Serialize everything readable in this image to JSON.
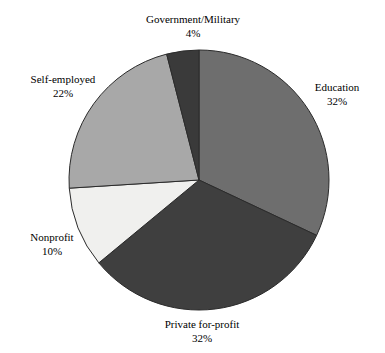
{
  "chart_data": {
    "type": "pie",
    "title": "",
    "subtitle": "",
    "xlabel": "",
    "ylabel": "",
    "legend_position": "none",
    "grid": false,
    "labels_inline": true,
    "start_angle_deg": 0,
    "direction": "clockwise",
    "categories": [
      "Education",
      "Private for-profit",
      "Nonprofit",
      "Self-employed",
      "Government/Military"
    ],
    "values": [
      32,
      32,
      10,
      22,
      4
    ],
    "value_suffix": "%",
    "slices": [
      {
        "name": "Education",
        "value": 32,
        "value_label": "32%",
        "color": "#6e6e6e",
        "start_deg": 0,
        "end_deg": 115.2
      },
      {
        "name": "Private for-profit",
        "value": 32,
        "value_label": "32%",
        "color": "#3f3f3f",
        "start_deg": 115.2,
        "end_deg": 230.4
      },
      {
        "name": "Nonprofit",
        "value": 10,
        "value_label": "10%",
        "color": "#f0f0ee",
        "start_deg": 230.4,
        "end_deg": 266.4
      },
      {
        "name": "Self-employed",
        "value": 22,
        "value_label": "22%",
        "color": "#a8a8a8",
        "start_deg": 266.4,
        "end_deg": 345.6
      },
      {
        "name": "Government/Military",
        "value": 4,
        "value_label": "4%",
        "color": "#3a3a3a",
        "start_deg": 345.6,
        "end_deg": 360
      }
    ],
    "outline_color": "#2b2b2b"
  },
  "labels": {
    "government": {
      "name": "Government/Military",
      "value": "4%"
    },
    "education": {
      "name": "Education",
      "value": "32%"
    },
    "self_employed": {
      "name": "Self-employed",
      "value": "22%"
    },
    "nonprofit": {
      "name": "Nonprofit",
      "value": "10%"
    },
    "private": {
      "name": "Private for-profit",
      "value": "32%"
    }
  }
}
